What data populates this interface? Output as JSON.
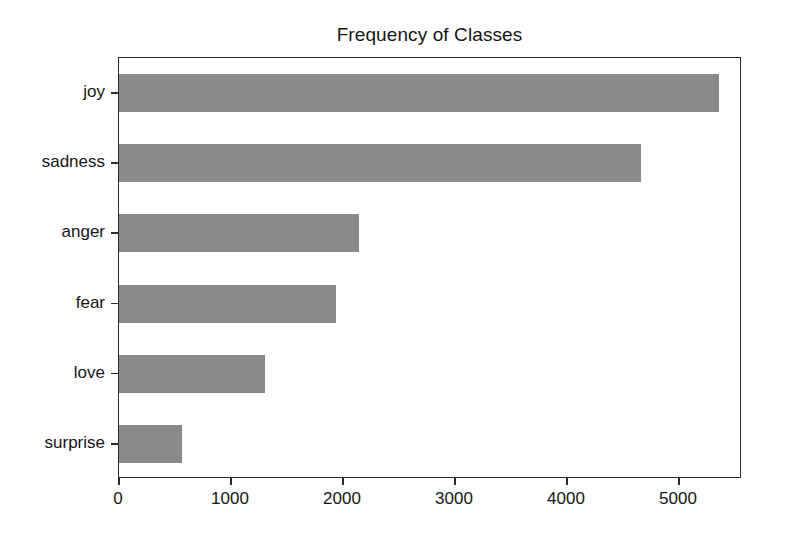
{
  "figure": {
    "width": 786,
    "height": 544,
    "background": "#ffffff"
  },
  "chart_data": {
    "type": "bar",
    "orientation": "horizontal",
    "title": "Frequency of Classes",
    "xlabel": "",
    "ylabel": "",
    "categories": [
      "joy",
      "sadness",
      "anger",
      "fear",
      "love",
      "surprise"
    ],
    "values": [
      5360,
      4660,
      2140,
      1940,
      1300,
      560
    ],
    "xlim": [
      0,
      5563
    ],
    "xticks": [
      0,
      1000,
      2000,
      3000,
      4000,
      5000
    ],
    "xtick_labels": [
      "0",
      "1000",
      "2000",
      "3000",
      "4000",
      "5000"
    ],
    "ytick_labels": [
      "joy",
      "sadness",
      "anger",
      "fear",
      "love",
      "surprise"
    ],
    "grid": false,
    "legend": false,
    "bar_color": "#8a8a8a",
    "axis_color": "#2b2b2b",
    "text_color": "#161616"
  }
}
